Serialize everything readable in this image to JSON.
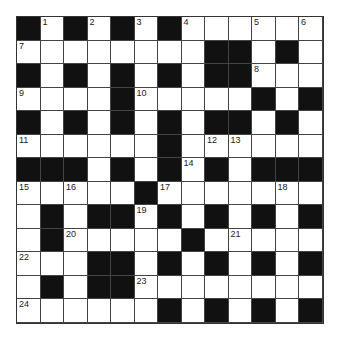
{
  "puzzle": {
    "rows": 13,
    "cols": 13,
    "layout": [
      "#.#.#.#......",
      "........##.#.",
      "#.#.#.#.##...",
      "....#.....#.#",
      "#.#.#.#.##.#.",
      "......#......",
      "###.#.#.#.###",
      ".....#.......",
      ".#.##.#.#.#.#",
      ".#.....#.....",
      "...##.#.#.#.#",
      ".#.##........",
      "......#.#.#.#"
    ],
    "numbers": [
      {
        "r": 0,
        "c": 1,
        "n": "1"
      },
      {
        "r": 0,
        "c": 3,
        "n": "2"
      },
      {
        "r": 0,
        "c": 5,
        "n": "3"
      },
      {
        "r": 0,
        "c": 7,
        "n": "4"
      },
      {
        "r": 0,
        "c": 10,
        "n": "5"
      },
      {
        "r": 0,
        "c": 12,
        "n": "6"
      },
      {
        "r": 1,
        "c": 0,
        "n": "7"
      },
      {
        "r": 2,
        "c": 10,
        "n": "8"
      },
      {
        "r": 3,
        "c": 0,
        "n": "9"
      },
      {
        "r": 3,
        "c": 5,
        "n": "10"
      },
      {
        "r": 5,
        "c": 0,
        "n": "11"
      },
      {
        "r": 5,
        "c": 8,
        "n": "12"
      },
      {
        "r": 5,
        "c": 9,
        "n": "13"
      },
      {
        "r": 6,
        "c": 7,
        "n": "14"
      },
      {
        "r": 7,
        "c": 0,
        "n": "15"
      },
      {
        "r": 7,
        "c": 2,
        "n": "16"
      },
      {
        "r": 7,
        "c": 6,
        "n": "17"
      },
      {
        "r": 7,
        "c": 11,
        "n": "18"
      },
      {
        "r": 8,
        "c": 5,
        "n": "19"
      },
      {
        "r": 9,
        "c": 2,
        "n": "20"
      },
      {
        "r": 9,
        "c": 9,
        "n": "21"
      },
      {
        "r": 10,
        "c": 0,
        "n": "22"
      },
      {
        "r": 11,
        "c": 5,
        "n": "23"
      },
      {
        "r": 12,
        "c": 0,
        "n": "24"
      }
    ]
  }
}
